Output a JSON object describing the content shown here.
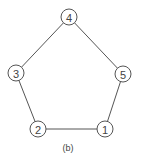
{
  "diagram": {
    "type": "graph",
    "caption": "(b)",
    "style": {
      "stroke_color": "#555555",
      "text_color": "#444444",
      "node_fill": "#ffffff",
      "node_radius": 8
    },
    "nodes": [
      {
        "id": "1",
        "label": "1",
        "x": 105,
        "y": 129
      },
      {
        "id": "2",
        "label": "2",
        "x": 38,
        "y": 129
      },
      {
        "id": "3",
        "label": "3",
        "x": 16,
        "y": 73
      },
      {
        "id": "4",
        "label": "4",
        "x": 69,
        "y": 17
      },
      {
        "id": "5",
        "label": "5",
        "x": 123,
        "y": 74
      }
    ],
    "edges": [
      {
        "from": "1",
        "to": "2"
      },
      {
        "from": "2",
        "to": "3"
      },
      {
        "from": "3",
        "to": "4"
      },
      {
        "from": "4",
        "to": "5"
      },
      {
        "from": "5",
        "to": "1"
      }
    ]
  }
}
